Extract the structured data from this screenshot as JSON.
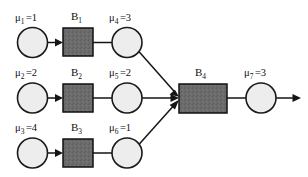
{
  "diagram": {
    "background_color": "#ffffff",
    "line_color": "#151515",
    "circle_fill": "#ededed",
    "circle_stroke": "#1a1a1a",
    "box_fill": "#6b6b6b",
    "box_stroke": "#111111",
    "stations": [
      {
        "id": "mu1",
        "symbol": "μ",
        "subscript": "1",
        "equals_value": "=1",
        "label": "μ₁ =1",
        "cx": 32.5,
        "cy": 42.5,
        "r": 15
      },
      {
        "id": "mu4",
        "symbol": "μ",
        "subscript": "4",
        "equals_value": "=3",
        "label": "μ₄ =3",
        "cx": 127,
        "cy": 42.5,
        "r": 15
      },
      {
        "id": "mu2",
        "symbol": "μ",
        "subscript": "2",
        "equals_value": "=2",
        "label": "μ₂ =2",
        "cx": 32.5,
        "cy": 98,
        "r": 15
      },
      {
        "id": "mu5",
        "symbol": "μ",
        "subscript": "5",
        "equals_value": "=2",
        "label": "μ₅ =2",
        "cx": 127,
        "cy": 98,
        "r": 15
      },
      {
        "id": "mu3",
        "symbol": "μ",
        "subscript": "3",
        "equals_value": "=4",
        "label": "μ₃ =4",
        "cx": 32.5,
        "cy": 153,
        "r": 15
      },
      {
        "id": "mu6",
        "symbol": "μ",
        "subscript": "6",
        "equals_value": "=1",
        "label": "μ₆ =1",
        "cx": 127,
        "cy": 153,
        "r": 15
      },
      {
        "id": "mu7",
        "symbol": "μ",
        "subscript": "7",
        "equals_value": "=3",
        "label": "μ₇ =3",
        "cx": 261,
        "cy": 98,
        "r": 15
      }
    ],
    "buffers": [
      {
        "id": "B1",
        "symbol": "B",
        "subscript": "1",
        "label": "B₁",
        "x": 63,
        "y": 28,
        "width": 30,
        "height": 28
      },
      {
        "id": "B2",
        "symbol": "B",
        "subscript": "2",
        "label": "B₂",
        "x": 63,
        "y": 84,
        "width": 30,
        "height": 28
      },
      {
        "id": "B3",
        "symbol": "B",
        "subscript": "3",
        "label": "B₃",
        "x": 63,
        "y": 139,
        "width": 30,
        "height": 28
      },
      {
        "id": "B4",
        "symbol": "B",
        "subscript": "4",
        "label": "B₄",
        "x": 179,
        "y": 84,
        "width": 48,
        "height": 29
      }
    ],
    "edges": [
      {
        "id": "edge-mu1-to-B1",
        "from": "mu1",
        "to": "B1",
        "arrow": true
      },
      {
        "id": "edge-B1-to-mu4",
        "from": "B1",
        "to": "mu4",
        "arrow": false
      },
      {
        "id": "edge-mu4-to-B4",
        "from": "mu4",
        "to": "B4",
        "arrow": true
      },
      {
        "id": "edge-mu2-to-B2",
        "from": "mu2",
        "to": "B2",
        "arrow": true
      },
      {
        "id": "edge-B2-to-mu5",
        "from": "B2",
        "to": "mu5",
        "arrow": false
      },
      {
        "id": "edge-mu5-to-B4",
        "from": "mu5",
        "to": "B4",
        "arrow": true
      },
      {
        "id": "edge-mu3-to-B3",
        "from": "mu3",
        "to": "B3",
        "arrow": true
      },
      {
        "id": "edge-B3-to-mu6",
        "from": "B3",
        "to": "mu6",
        "arrow": false
      },
      {
        "id": "edge-mu6-to-B4",
        "from": "mu6",
        "to": "B4",
        "arrow": true
      },
      {
        "id": "edge-B4-to-mu7",
        "from": "B4",
        "to": "mu7",
        "arrow": false
      },
      {
        "id": "edge-mu7-to-exit",
        "from": "mu7",
        "to": "exit",
        "arrow": true
      }
    ]
  }
}
